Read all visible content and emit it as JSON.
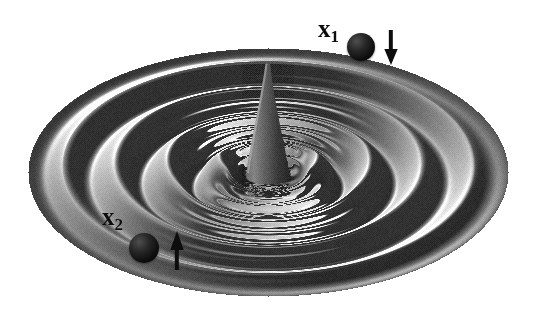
{
  "figure": {
    "kind": "3d-surface-plot",
    "title": "",
    "background_color": "#ffffff",
    "width": 535,
    "height": 316
  },
  "chart_data": {
    "type": "surface",
    "title": "",
    "xlabel": "",
    "ylabel": "",
    "zlabel": "",
    "projection": "oblique-3d",
    "colormap": "grayscale",
    "surface": {
      "shape": "elliptical-disc",
      "center_x": 268,
      "center_y": 172,
      "radius_x": 240,
      "radius_y": 124,
      "ripple_count": 5,
      "ripple_type": "concentric-radial-waves",
      "central_feature": "tall-narrow-cone-spike",
      "cone_apex_x": 268,
      "cone_apex_y": 62,
      "cone_base_y": 175,
      "cone_half_width": 22,
      "light_direction": "upper-left",
      "rim_shade": "#6f6f6f",
      "highlight_shade": "#efefef",
      "trough_shade": "#4a4a4a"
    },
    "annotations": [
      {
        "id": "x1",
        "label": "x",
        "subscript": "1",
        "label_x": 318,
        "label_y": 16,
        "ball_x": 347,
        "ball_y": 33,
        "ball_diameter": 28,
        "ball_color": "#101010",
        "arrow_direction": "down",
        "arrow_x": 382,
        "arrow_y": 30,
        "arrow_length": 36,
        "arrow_color": "#0d0d0d"
      },
      {
        "id": "x2",
        "label": "x",
        "subscript": "2",
        "label_x": 102,
        "label_y": 204,
        "ball_x": 129,
        "ball_y": 233,
        "ball_diameter": 30,
        "ball_color": "#101010",
        "arrow_direction": "up",
        "arrow_x": 168,
        "arrow_y": 230,
        "arrow_length": 40,
        "arrow_color": "#0d0d0d"
      }
    ],
    "legend": null,
    "grid": false,
    "axes_visible": false
  }
}
